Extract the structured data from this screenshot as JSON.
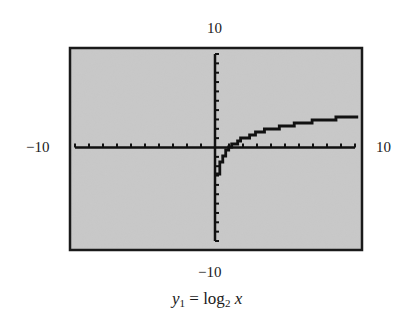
{
  "chart_data": {
    "type": "line",
    "title": "",
    "caption": {
      "var": "y",
      "var_sub": "1",
      "equals": " = ",
      "func": "log",
      "func_sub": "2",
      "arg": "x"
    },
    "window": {
      "xmin": -10,
      "xmax": 10,
      "ymin": -10,
      "ymax": 10,
      "xscl": 1,
      "yscl": 1
    },
    "labels": {
      "xmin": "−10",
      "xmax": "10",
      "ymin": "−10",
      "ymax": "10"
    },
    "series": [
      {
        "name": "y1 = log2 x",
        "x": [
          0.25,
          0.5,
          0.75,
          1,
          1.5,
          2,
          3,
          4,
          5,
          6,
          7,
          8,
          9,
          10
        ],
        "y": [
          -2,
          -1,
          -0.42,
          0,
          0.58,
          1,
          1.58,
          2,
          2.32,
          2.58,
          2.81,
          3,
          3.17,
          3.32
        ]
      }
    ],
    "grid": false,
    "legend": null,
    "colors": {
      "screen_bg": "#c9c9c9",
      "frame": "#1a1a1a",
      "axes": "#111111",
      "curve": "#111111"
    }
  }
}
